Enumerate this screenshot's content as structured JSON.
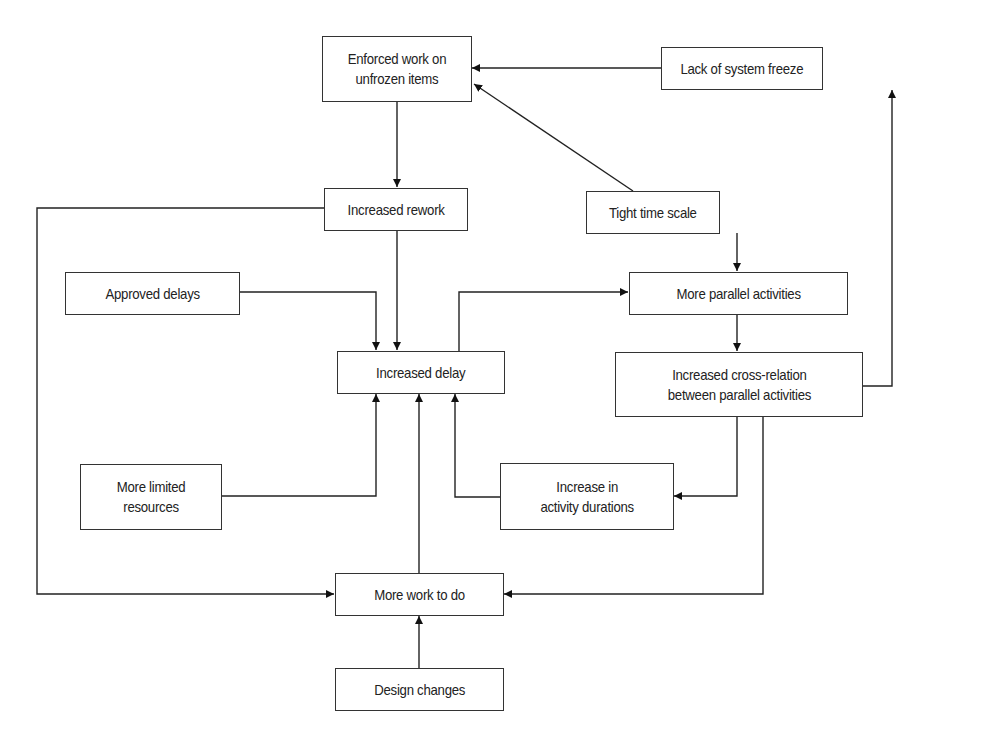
{
  "diagram": {
    "nodes": [
      {
        "id": "enforced_work",
        "label": "Enforced work on\nunfrozen items"
      },
      {
        "id": "lack_freeze",
        "label": "Lack of system freeze"
      },
      {
        "id": "increased_rework",
        "label": "Increased rework"
      },
      {
        "id": "tight_time",
        "label": "Tight time scale"
      },
      {
        "id": "approved_delays",
        "label": "Approved delays"
      },
      {
        "id": "more_parallel",
        "label": "More parallel activities"
      },
      {
        "id": "increased_delay",
        "label": "Increased delay"
      },
      {
        "id": "cross_relation",
        "label": "Increased cross-relation\nbetween parallel activities"
      },
      {
        "id": "limited_resources",
        "label": "More limited\nresources"
      },
      {
        "id": "activity_durations",
        "label": "Increase in\nactivity durations"
      },
      {
        "id": "more_work",
        "label": "More work to do"
      },
      {
        "id": "design_changes",
        "label": "Design changes"
      }
    ],
    "edges": [
      {
        "from": "lack_freeze",
        "to": "enforced_work"
      },
      {
        "from": "tight_time",
        "to": "enforced_work"
      },
      {
        "from": "enforced_work",
        "to": "increased_rework"
      },
      {
        "from": "increased_rework",
        "to": "increased_delay"
      },
      {
        "from": "increased_rework",
        "to": "more_work"
      },
      {
        "from": "tight_time",
        "to": "more_parallel"
      },
      {
        "from": "approved_delays",
        "to": "increased_delay"
      },
      {
        "from": "increased_delay",
        "to": "more_parallel"
      },
      {
        "from": "more_parallel",
        "to": "cross_relation"
      },
      {
        "from": "cross_relation",
        "to": "lack_freeze"
      },
      {
        "from": "cross_relation",
        "to": "activity_durations"
      },
      {
        "from": "cross_relation",
        "to": "more_work"
      },
      {
        "from": "limited_resources",
        "to": "increased_delay"
      },
      {
        "from": "activity_durations",
        "to": "increased_delay"
      },
      {
        "from": "more_work",
        "to": "increased_delay"
      },
      {
        "from": "design_changes",
        "to": "more_work"
      }
    ]
  }
}
